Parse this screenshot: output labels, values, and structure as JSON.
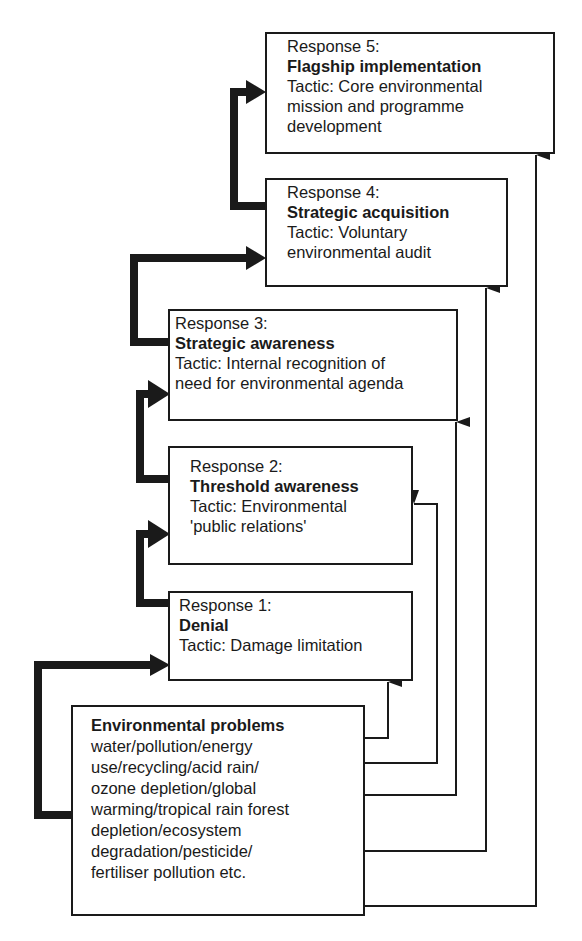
{
  "diagram": {
    "type": "staircase-flow",
    "responses": [
      {
        "id": 1,
        "heading": "Response 1:",
        "title": "Denial",
        "tactic_lines": [
          "Tactic: Damage limitation"
        ]
      },
      {
        "id": 2,
        "heading": "Response 2:",
        "title": "Threshold awareness",
        "tactic_lines": [
          "Tactic: Environmental",
          "'public relations'"
        ]
      },
      {
        "id": 3,
        "heading": "Response 3:",
        "title": "Strategic awareness",
        "tactic_lines": [
          "Tactic: Internal recognition of",
          "need for environmental agenda"
        ]
      },
      {
        "id": 4,
        "heading": "Response 4:",
        "title": "Strategic acquisition",
        "tactic_lines": [
          "Tactic: Voluntary",
          "environmental audit"
        ]
      },
      {
        "id": 5,
        "heading": "Response 5:",
        "title": "Flagship implementation",
        "tactic_lines": [
          "Tactic: Core environmental",
          "mission and programme",
          "development"
        ]
      }
    ],
    "source": {
      "title": "Environmental problems",
      "lines": [
        "water/pollution/energy",
        "use/recycling/acid rain/",
        "ozone depletion/global",
        "warming/tropical rain forest",
        "depletion/ecosystem",
        "degradation/pesticide/",
        "fertiliser pollution etc."
      ]
    },
    "connectors": {
      "thick_progression": [
        "source→response1",
        "response1→response2",
        "response2→response3",
        "response3→response4",
        "response4→response5"
      ],
      "thin_direct": [
        "source→response1",
        "source→response2",
        "source→response3",
        "source→response4",
        "source→response5"
      ]
    },
    "colors": {
      "line": "#1a1a1a",
      "background": "#ffffff"
    }
  }
}
